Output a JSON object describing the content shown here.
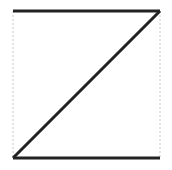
{
  "diagram": {
    "shape": "Z",
    "stroke_color": "#222222",
    "guide_color": "#c8c8c8",
    "background": "#ffffff",
    "lines": [
      {
        "name": "top-edge",
        "x1": 13,
        "y1": 11,
        "x2": 160,
        "y2": 11
      },
      {
        "name": "diagonal",
        "x1": 160,
        "y1": 11,
        "x2": 13,
        "y2": 158
      },
      {
        "name": "bottom-edge",
        "x1": 13,
        "y1": 158,
        "x2": 160,
        "y2": 158
      }
    ],
    "guides": [
      {
        "name": "left-guide",
        "x1": 13,
        "y1": 11,
        "x2": 13,
        "y2": 158
      },
      {
        "name": "right-guide",
        "x1": 160,
        "y1": 11,
        "x2": 160,
        "y2": 158
      }
    ]
  }
}
